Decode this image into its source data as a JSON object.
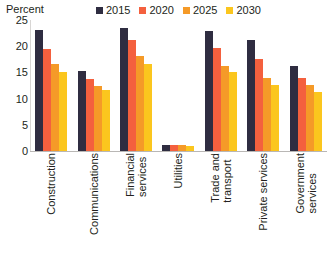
{
  "axis_title": "Percent",
  "colors": {
    "2015": "#2f2d41",
    "2020": "#f4603e",
    "2025": "#f59a28",
    "2030": "#fbc61e",
    "axis": "#b9b7b5",
    "text": "#231f20"
  },
  "legend": {
    "items": [
      {
        "label": "2015",
        "color": "#2f2d41",
        "swatch": "square-swatch"
      },
      {
        "label": "2020",
        "color": "#f4603e",
        "swatch": "square-swatch"
      },
      {
        "label": "2025",
        "color": "#f59a28",
        "swatch": "square-swatch"
      },
      {
        "label": "2030",
        "color": "#fbc61e",
        "swatch": "square-swatch"
      }
    ]
  },
  "yticks": [
    "25",
    "20",
    "15",
    "10",
    "5",
    "0"
  ],
  "chart_data": {
    "type": "bar",
    "title": "",
    "xlabel": "",
    "ylabel": "Percent",
    "ylim": [
      0,
      25
    ],
    "ytick_values": [
      0,
      5,
      10,
      15,
      20,
      25
    ],
    "grid": false,
    "legend_position": "top-right",
    "categories": [
      "Construction",
      "Communications",
      "Financial services",
      "Utilities",
      "Trade and transport",
      "Private services",
      "Government services"
    ],
    "category_lines": [
      [
        "Construction"
      ],
      [
        "Communications"
      ],
      [
        "Financial",
        "services"
      ],
      [
        "Utilities"
      ],
      [
        "Trade and",
        "transport"
      ],
      [
        "Private services"
      ],
      [
        "Government",
        "services"
      ]
    ],
    "series": [
      {
        "name": "2015",
        "color": "#2f2d41",
        "values": [
          23.0,
          15.2,
          23.4,
          1.2,
          22.9,
          21.2,
          16.2
        ]
      },
      {
        "name": "2020",
        "color": "#f4603e",
        "values": [
          19.4,
          13.8,
          21.2,
          1.1,
          19.6,
          17.5,
          14.0
        ]
      },
      {
        "name": "2025",
        "color": "#f59a28",
        "values": [
          16.6,
          12.4,
          18.1,
          1.1,
          16.3,
          14.0,
          12.6
        ]
      },
      {
        "name": "2030",
        "color": "#fbc61e",
        "values": [
          15.0,
          11.6,
          16.6,
          1.0,
          15.1,
          12.6,
          11.3
        ]
      }
    ]
  }
}
